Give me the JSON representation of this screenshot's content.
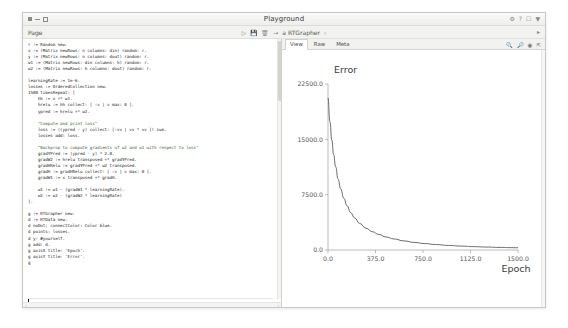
{
  "window": {
    "title": "Playground",
    "buttons": {
      "close": "dot",
      "minimize": "dash",
      "maximize": "square"
    },
    "title_icons": [
      "gear-icon",
      "help-icon",
      "window-icon",
      "menu-icon"
    ]
  },
  "toolbar": {
    "page_label": "Page",
    "breadcrumb_icons": [
      "run-icon",
      "save-icon",
      "trash-icon",
      "arrow-icon"
    ],
    "breadcrumb_text": "a RTGrapher",
    "breadcrumb_chevron": "›",
    "right_icon": "page-menu-icon"
  },
  "editor": {
    "code_lines": [
      "r := Random new.",
      "x := (Matrix newRows: n columns: din) random: r.",
      "y := (Matrix newRows: n columns: dout) random: r.",
      "w1 := (Matrix newRows: din columns: h) random: r.",
      "w2 := (Matrix newRows: h columns: dout) random: r.",
      "",
      "learningRate := 1e-6.",
      "losses := OrderedCollection new.",
      "1500 timesRepeat: [",
      "    hh := x +* w1.",
      "    hrelu := hh collect: [ :v | v max: 0 ].",
      "    ypred := hrelu +* w2.",
      "",
      "    \"Compute and print loss\"",
      "    loss := ((ypred - y) collect: [:vv | vv * vv ]) sum.",
      "    losses add: loss.",
      "",
      "    \"Backprop to compute gradients of w2 and w1 with respect to loss\"",
      "    gradYPred := (ypred - y) * 2.0.",
      "    gradW2 := hrelu transposed +* gradYPred.",
      "    gradHRelu := gradYPred +* w2 transposed.",
      "    gradH := gradHRelu collect: [ :v | v max: 0 ].",
      "    gradW1 := x transposed +* gradH.",
      "",
      "    w1 := w1 - (gradW1 * learningRate).",
      "    w2 := w2 - (gradW2 * learningRate)",
      "].",
      "",
      "g := RTGrapher new.",
      "d := RTData new.",
      "d noDot; connectColor: Color blue.",
      "d points: losses.",
      "d y: #yourself.",
      "g add: d.",
      "g axisX title: 'Epoch'.",
      "g axisY title: 'Error'.",
      "g"
    ],
    "comment_lines": [
      13,
      17
    ],
    "scroll_left_arrow": "‹",
    "scroll_right_arrow": "›"
  },
  "inspector": {
    "tabs": [
      {
        "label": "View",
        "active": true
      },
      {
        "label": "Raw",
        "active": false
      },
      {
        "label": "Meta",
        "active": false
      }
    ],
    "icons": [
      "zoom-out-icon",
      "zoom-in-icon",
      "target-icon",
      "expand-icon"
    ]
  },
  "chart_data": {
    "type": "line",
    "title": "Error",
    "xlabel": "Epoch",
    "ylabel": "",
    "y_axis_title": "Error",
    "xlim": [
      0,
      1500
    ],
    "ylim": [
      0,
      22500
    ],
    "xticks": [
      "0.0",
      "375.0",
      "750.0",
      "1125.0",
      "1500.0"
    ],
    "xtick_values": [
      0,
      375,
      750,
      1125,
      1500
    ],
    "yticks": [
      "0.0",
      "7500.0",
      "15000.0",
      "22500.0"
    ],
    "ytick_values": [
      0,
      7500,
      15000,
      22500
    ],
    "grid": false,
    "legend": "none",
    "line_color": "#5a5a5a",
    "series": [
      {
        "name": "loss",
        "x": [
          0,
          15,
          30,
          45,
          60,
          80,
          100,
          125,
          150,
          180,
          210,
          250,
          300,
          350,
          400,
          460,
          520,
          600,
          680,
          760,
          850,
          950,
          1050,
          1150,
          1250,
          1350,
          1450,
          1500
        ],
        "y": [
          20600,
          17400,
          14900,
          12900,
          11300,
          9600,
          8300,
          7000,
          6000,
          5050,
          4350,
          3600,
          2950,
          2480,
          2120,
          1760,
          1500,
          1230,
          1030,
          880,
          740,
          620,
          530,
          455,
          400,
          355,
          320,
          305
        ]
      }
    ]
  }
}
